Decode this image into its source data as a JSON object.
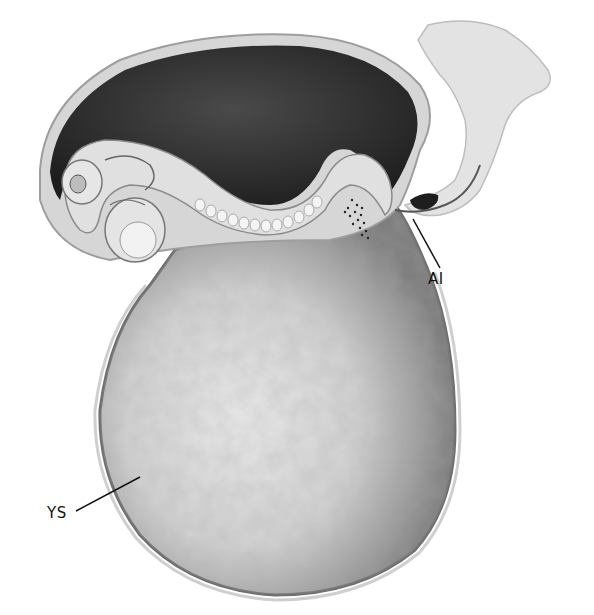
{
  "figure": {
    "colors": {
      "amnion_cavity": "#2a2a2a",
      "membrane": "#bdbdbd",
      "yolk_sac_center": "#e8e8e8",
      "yolk_sac_edge": "#8a8a8a",
      "embryo": "#d8d8d8",
      "stalk": "#dcdcdc"
    },
    "labels": [
      {
        "id": "AI",
        "text": "AI",
        "meaning": "allantois"
      },
      {
        "id": "YS",
        "text": "YS",
        "meaning": "yolk sac"
      }
    ]
  }
}
